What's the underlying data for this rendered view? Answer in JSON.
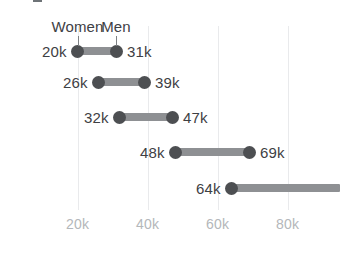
{
  "chart_data": {
    "type": "bar",
    "subtype": "dumbbell-range",
    "title": "",
    "xlabel": "",
    "ylabel": "",
    "xlim": [
      0,
      95
    ],
    "grid": true,
    "legend_position": "inline-annotation",
    "x_unit": "k",
    "xticks": [
      {
        "value": 20,
        "label": "20k"
      },
      {
        "value": 40,
        "label": "40k"
      },
      {
        "value": 60,
        "label": "60k"
      },
      {
        "value": 80,
        "label": "80k"
      }
    ],
    "series": [
      {
        "name": "Women",
        "values": [
          20,
          26,
          32,
          48,
          64
        ]
      },
      {
        "name": "Men",
        "values": [
          31,
          39,
          47,
          69,
          null
        ]
      }
    ],
    "categories": [
      "",
      "",
      "",
      "",
      ""
    ],
    "rows": [
      {
        "start": 20,
        "end": 31,
        "start_label": "20k",
        "end_label": "31k",
        "clipped": false
      },
      {
        "start": 26,
        "end": 39,
        "start_label": "26k",
        "end_label": "39k",
        "clipped": false
      },
      {
        "start": 32,
        "end": 47,
        "start_label": "32k",
        "end_label": "47k",
        "clipped": false
      },
      {
        "start": 48,
        "end": 69,
        "start_label": "48k",
        "end_label": "69k",
        "clipped": false
      },
      {
        "start": 64,
        "end": 95,
        "start_label": "64k",
        "end_label": "",
        "clipped": true
      }
    ],
    "annotations": [
      {
        "text": "Women",
        "points_to_value": 20,
        "row": 0
      },
      {
        "text": "Men",
        "points_to_value": 31,
        "row": 0
      }
    ],
    "colors": {
      "dot": "#4d4f52",
      "connector": "#8e9093",
      "value_label": "#3e4044",
      "tick_label": "#b4b7ba",
      "gridline": "#e9eaec",
      "background": "#ffffff"
    }
  }
}
